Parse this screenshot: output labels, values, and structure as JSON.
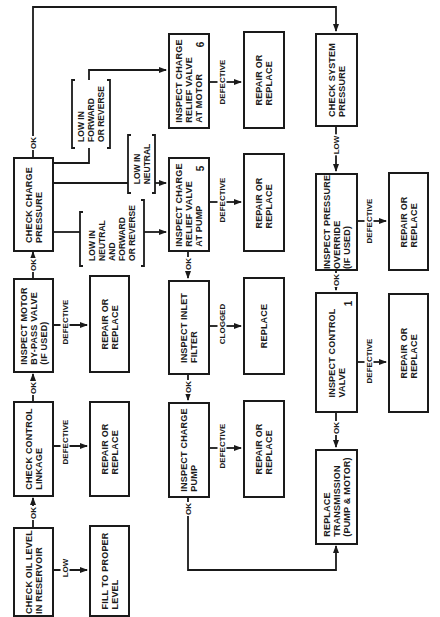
{
  "diagram": {
    "type": "troubleshooting-flowchart",
    "orientation": "rotated-90-ccw",
    "nodes": {
      "check_oil_level": {
        "label": "CHECK OIL LEVEL\nIN RESERVOIR"
      },
      "fill_to_proper_level": {
        "label": "FILL TO PROPER\nLEVEL"
      },
      "check_control_linkage": {
        "label": "CHECK CONTROL\nLINKAGE"
      },
      "repair_linkage": {
        "label": "REPAIR OR\nREPLACE"
      },
      "inspect_motor_bypass": {
        "label": "INSPECT MOTOR\nBY-PASS VALVE\n(IF USED)"
      },
      "repair_bypass": {
        "label": "REPAIR OR\nREPLACE"
      },
      "check_charge_pressure": {
        "label": "CHECK CHARGE\nPRESSURE"
      },
      "inspect_relief_motor": {
        "label": "INSPECT CHARGE\nRELIEF VALVE\nAT MOTOR",
        "number": "6"
      },
      "repair_relief_motor": {
        "label": "REPAIR OR\nREPLACE"
      },
      "inspect_relief_pump": {
        "label": "INSPECT CHARGE\nRELIEF VALVE\nAT PUMP",
        "number": "5"
      },
      "repair_relief_pump": {
        "label": "REPAIR OR\nREPLACE"
      },
      "inspect_inlet_filter": {
        "label": "INSPECT INLET\nFILTER"
      },
      "replace_filter": {
        "label": "REPLACE"
      },
      "inspect_charge_pump": {
        "label": "INSPECT CHARGE\nPUMP"
      },
      "repair_charge_pump": {
        "label": "REPAIR OR\nREPLACE"
      },
      "check_system_pressure": {
        "label": "CHECK SYSTEM\nPRESSURE"
      },
      "inspect_pressure_override": {
        "label": "INSPECT PRESSURE\nOVERRIDE\n(IF USED)"
      },
      "repair_override": {
        "label": "REPAIR OR\nREPLACE"
      },
      "inspect_control_valve": {
        "label": "INSPECT CONTROL\nVALVE",
        "number": "1"
      },
      "repair_control_valve": {
        "label": "REPAIR OR\nREPLACE"
      },
      "replace_transmission": {
        "label": "REPLACE\nTRANSMISSION\n(PUMP & MOTOR)"
      }
    },
    "edge_labels": {
      "ok": "OK",
      "low": "LOW",
      "defective": "DEFECTIVE",
      "clogged": "CLOGGED",
      "low_fwd_rev": "LOW IN\nFORWARD\nOR REVERSE",
      "low_neutral": "LOW IN\nNEUTRAL",
      "low_neutral_and_fwd_rev": "LOW IN\nNEUTRAL\nAND\nFORWARD\nOR REVERSE"
    },
    "edges": [
      {
        "from": "check_oil_level",
        "to": "check_control_linkage",
        "label": "OK"
      },
      {
        "from": "check_oil_level",
        "to": "fill_to_proper_level",
        "label": "LOW"
      },
      {
        "from": "check_control_linkage",
        "to": "inspect_motor_bypass",
        "label": "OK"
      },
      {
        "from": "check_control_linkage",
        "to": "repair_linkage",
        "label": "DEFECTIVE"
      },
      {
        "from": "inspect_motor_bypass",
        "to": "check_charge_pressure",
        "label": "OK"
      },
      {
        "from": "inspect_motor_bypass",
        "to": "repair_bypass",
        "label": "DEFECTIVE"
      },
      {
        "from": "check_charge_pressure",
        "to": "check_system_pressure",
        "label": "OK"
      },
      {
        "from": "check_charge_pressure",
        "to": "inspect_relief_motor",
        "label": "LOW IN FORWARD OR REVERSE"
      },
      {
        "from": "check_charge_pressure",
        "to": "inspect_relief_pump",
        "label": "LOW IN NEUTRAL"
      },
      {
        "from": "check_charge_pressure",
        "to": "inspect_relief_pump",
        "label": "LOW IN NEUTRAL AND FORWARD OR REVERSE"
      },
      {
        "from": "inspect_relief_motor",
        "to": "repair_relief_motor",
        "label": "DEFECTIVE"
      },
      {
        "from": "inspect_relief_pump",
        "to": "repair_relief_pump",
        "label": "DEFECTIVE"
      },
      {
        "from": "inspect_relief_pump",
        "to": "inspect_inlet_filter",
        "label": "OK"
      },
      {
        "from": "inspect_inlet_filter",
        "to": "replace_filter",
        "label": "CLOGGED"
      },
      {
        "from": "inspect_inlet_filter",
        "to": "inspect_charge_pump",
        "label": "OK"
      },
      {
        "from": "inspect_charge_pump",
        "to": "repair_charge_pump",
        "label": "DEFECTIVE"
      },
      {
        "from": "inspect_charge_pump",
        "to": "replace_transmission",
        "label": "OK"
      },
      {
        "from": "check_system_pressure",
        "to": "inspect_pressure_override",
        "label": "LOW"
      },
      {
        "from": "inspect_pressure_override",
        "to": "repair_override",
        "label": "DEFECTIVE"
      },
      {
        "from": "inspect_pressure_override",
        "to": "inspect_control_valve",
        "label": "OK"
      },
      {
        "from": "inspect_control_valve",
        "to": "repair_control_valve",
        "label": "DEFECTIVE"
      },
      {
        "from": "inspect_control_valve",
        "to": "replace_transmission",
        "label": "OK"
      }
    ]
  },
  "colors": {
    "ink": "#1a1a1a",
    "paper": "#ffffff"
  }
}
